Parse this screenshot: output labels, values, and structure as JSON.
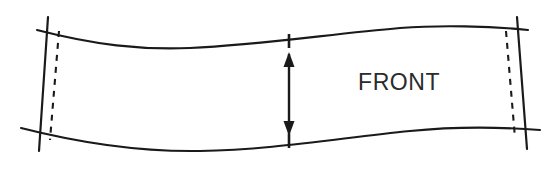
{
  "drawing": {
    "title": "Pattern piece front panel diagram",
    "background_color": "#ffffff",
    "line_color": "#1a1a1a",
    "label_color": "#2b2b2b",
    "labels": {
      "front": "FRONT"
    },
    "geometry": {
      "top_curve_path": "M 37,30 C 95,45 140,50 190,48 C 260,45 330,34 400,28 C 440,25 490,26 528,30",
      "bottom_curve_path": "M 21,128 C 80,143 140,152 200,151 C 270,150 340,138 410,131 C 450,127 500,127 540,130",
      "left_solid_line": {
        "x1": 48,
        "y1": 17,
        "x2": 39,
        "y2": 151
      },
      "right_solid_line": {
        "x1": 517,
        "y1": 17,
        "x2": 527,
        "y2": 149
      },
      "left_dashed_line": {
        "x1": 59,
        "y1": 31,
        "x2": 50,
        "y2": 140
      },
      "right_dashed_line": {
        "x1": 506,
        "y1": 31,
        "x2": 515,
        "y2": 138
      },
      "dimension_arrow": {
        "x": 289,
        "y_top": 52,
        "y_bottom": 136
      },
      "notch_top": {
        "x": 289,
        "y1": 34,
        "y2": 48
      },
      "notch_bottom": {
        "x": 289,
        "y1": 134,
        "y2": 148
      },
      "front_label_position": {
        "x": 358,
        "y": 90
      }
    }
  }
}
